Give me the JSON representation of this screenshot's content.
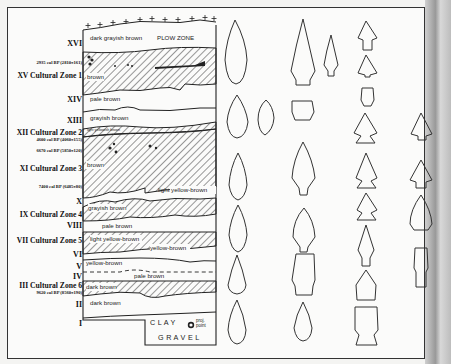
{
  "figure": {
    "type": "stratigraphic profile with projectile point types",
    "strata_labels": [
      {
        "id": "XVI",
        "text": "XVI"
      },
      {
        "id": "date_2935",
        "text": "2935 cal BP (2810±161)"
      },
      {
        "id": "XV",
        "text": "XV Cultural Zone 1"
      },
      {
        "id": "XIV",
        "text": "XIV"
      },
      {
        "id": "XIII",
        "text": "XIII"
      },
      {
        "id": "XII",
        "text": "XII Cultural Zone 2"
      },
      {
        "id": "date_4600",
        "text": "4600 cal BP (4060±155)"
      },
      {
        "id": "date_6670",
        "text": "6670 cal BP (5850±120)"
      },
      {
        "id": "XI",
        "text": "XI Cultural Zone 3"
      },
      {
        "id": "date_7400",
        "text": "7400 cal BP (6485±80)"
      },
      {
        "id": "X",
        "text": "X"
      },
      {
        "id": "IX",
        "text": "IX Cultural Zone 4"
      },
      {
        "id": "VIII",
        "text": "VIII"
      },
      {
        "id": "VII",
        "text": "VII Cultural Zone 5"
      },
      {
        "id": "VI",
        "text": "VI"
      },
      {
        "id": "V",
        "text": "V"
      },
      {
        "id": "IV",
        "text": "IV"
      },
      {
        "id": "III",
        "text": "III Cultural Zone 6"
      },
      {
        "id": "date_9620",
        "text": "9620 cal BP (8560±190)"
      },
      {
        "id": "II",
        "text": "II"
      },
      {
        "id": "I",
        "text": "I"
      }
    ],
    "sediment_labels": {
      "dark_grayish_brown": "dark grayish brown",
      "plow_zone": "PLOW ZONE",
      "brown_xv": "brown",
      "pale_brown_xiv": "pale brown",
      "grayish_brown_xiii": "grayish brown",
      "light_yellowish_brown_xii": "light yellowish brown",
      "brown_xi": "brown",
      "light_yellow_brown_x": "light yellow-brown",
      "grayish_brown_ix": "grayish brown",
      "pale_brown_viii": "pale brown",
      "light_yellow_brown_vii": "light yellow-brown",
      "yellow_brown_vi": "yellow-brown",
      "yellow_brown_v": "yellow-brown",
      "pale_brown_iv": "pale brown",
      "dark_brown_iii": "dark brown",
      "dark_brown_ii": "dark brown",
      "clay": "C L A Y",
      "gravel": "G R A V E L"
    },
    "legend": {
      "symbol": "proj-point-icon",
      "line1": "proj.",
      "line2": "point"
    },
    "colors": {
      "ink": "#222222",
      "paper": "#fbfbfa",
      "frame": "#333333"
    }
  }
}
